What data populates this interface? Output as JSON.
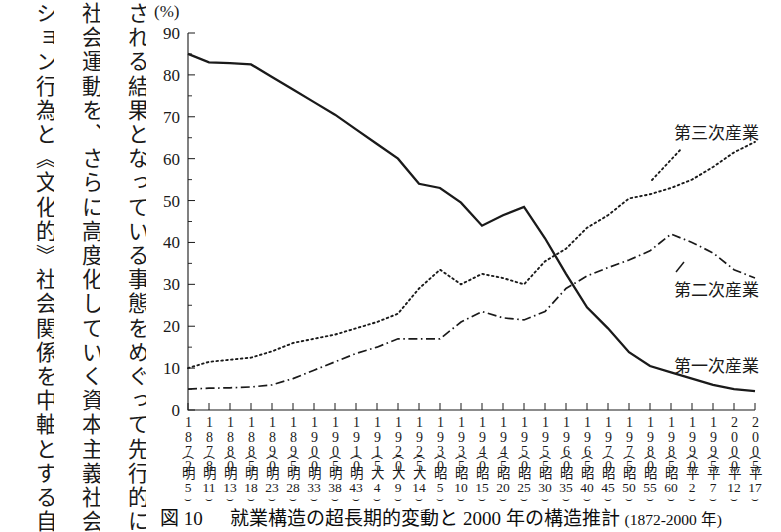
{
  "body_text": {
    "columns": [
      "される結果となっている事態をめぐって先行的に",
      "社会運動を、さらに高度化していく資本主義社会",
      "ション行為と《文化的》社会関係を中軸とする自"
    ]
  },
  "figure": {
    "unit_label": "(%)",
    "caption_figure_label": "図 10",
    "caption_title": "就業構造の超長期的変動と 2000 年の構造推計",
    "caption_range": "(1872-2000 年)"
  },
  "series_labels": {
    "tertiary": "第三次産業",
    "secondary": "第二次産業",
    "primary": "第一次産業"
  },
  "x_axis": {
    "ticks": [
      {
        "year": "1872",
        "era": "明",
        "era_num": "5"
      },
      {
        "year": "1878",
        "era": "明",
        "era_num": "11"
      },
      {
        "year": "1880",
        "era": "明",
        "era_num": "13"
      },
      {
        "year": "1885",
        "era": "明",
        "era_num": "18"
      },
      {
        "year": "1890",
        "era": "明",
        "era_num": "23"
      },
      {
        "year": "1895",
        "era": "明",
        "era_num": "28"
      },
      {
        "year": "1900",
        "era": "明",
        "era_num": "33"
      },
      {
        "year": "1905",
        "era": "明",
        "era_num": "38"
      },
      {
        "year": "1910",
        "era": "明",
        "era_num": "43"
      },
      {
        "year": "1915",
        "era": "大",
        "era_num": "4"
      },
      {
        "year": "1920",
        "era": "大",
        "era_num": "9"
      },
      {
        "year": "1925",
        "era": "大",
        "era_num": "14"
      },
      {
        "year": "1930",
        "era": "昭",
        "era_num": "5"
      },
      {
        "year": "1935",
        "era": "昭",
        "era_num": "10"
      },
      {
        "year": "1940",
        "era": "昭",
        "era_num": "15"
      },
      {
        "year": "1945",
        "era": "昭",
        "era_num": "20"
      },
      {
        "year": "1950",
        "era": "昭",
        "era_num": "25"
      },
      {
        "year": "1955",
        "era": "昭",
        "era_num": "30"
      },
      {
        "year": "1960",
        "era": "昭",
        "era_num": "35"
      },
      {
        "year": "1965",
        "era": "昭",
        "era_num": "40"
      },
      {
        "year": "1970",
        "era": "昭",
        "era_num": "45"
      },
      {
        "year": "1975",
        "era": "昭",
        "era_num": "50"
      },
      {
        "year": "1980",
        "era": "昭",
        "era_num": "55"
      },
      {
        "year": "1985",
        "era": "昭",
        "era_num": "60"
      },
      {
        "year": "1990",
        "era": "平",
        "era_num": "2"
      },
      {
        "year": "1995",
        "era": "平",
        "era_num": "7"
      },
      {
        "year": "2000",
        "era": "平",
        "era_num": "12"
      },
      {
        "year": "2005",
        "era": "平",
        "era_num": "17"
      }
    ]
  },
  "chart_data": {
    "type": "line",
    "title": "就業構造の超長期的変動と 2000 年の構造推計 (1872-2000 年)",
    "xlabel": "",
    "ylabel": "(%)",
    "ylim": [
      0,
      90
    ],
    "ytick_labels": [
      "0",
      "10",
      "20",
      "30",
      "40",
      "50",
      "60",
      "70",
      "80",
      "90"
    ],
    "ytick_values": [
      0,
      10,
      20,
      30,
      40,
      50,
      60,
      70,
      80,
      90
    ],
    "y_minor_step": 5,
    "grid": false,
    "legend_position": "inline-right",
    "x": [
      1872,
      1878,
      1880,
      1885,
      1890,
      1895,
      1900,
      1905,
      1910,
      1915,
      1920,
      1925,
      1930,
      1935,
      1940,
      1945,
      1950,
      1955,
      1960,
      1965,
      1970,
      1975,
      1980,
      1985,
      1990,
      1995,
      2000,
      2005
    ],
    "series": [
      {
        "name": "第一次産業",
        "style": "solid",
        "values": [
          85.0,
          83.0,
          82.8,
          82.5,
          79.5,
          76.5,
          73.5,
          70.5,
          67.0,
          63.5,
          60.0,
          54.0,
          53.0,
          49.5,
          44.0,
          46.5,
          48.5,
          41.0,
          32.5,
          24.5,
          19.5,
          13.8,
          10.5,
          9.0,
          7.5,
          6.0,
          5.0,
          4.5
        ]
      },
      {
        "name": "第二次産業",
        "style": "dash-dot",
        "values": [
          5.0,
          5.2,
          5.3,
          5.5,
          6.0,
          7.5,
          9.5,
          11.5,
          13.5,
          15.0,
          17.0,
          17.0,
          17.0,
          21.0,
          23.5,
          22.0,
          21.5,
          23.5,
          29.0,
          32.0,
          34.0,
          35.8,
          38.0,
          42.0,
          40.0,
          37.5,
          33.5,
          31.5
        ]
      },
      {
        "name": "第三次産業",
        "style": "dotted",
        "values": [
          10.0,
          11.5,
          12.0,
          12.5,
          14.0,
          16.0,
          17.0,
          18.0,
          19.5,
          21.0,
          23.0,
          29.0,
          33.5,
          30.0,
          32.5,
          31.5,
          30.0,
          35.5,
          38.5,
          43.5,
          46.5,
          50.5,
          51.5,
          53.0,
          55.0,
          58.0,
          61.5,
          64.0
        ]
      }
    ]
  },
  "colors": {
    "ink": "#1a1a1a",
    "background": "#ffffff"
  }
}
